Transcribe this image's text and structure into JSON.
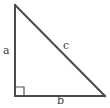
{
  "figure": {
    "name": "right-triangle",
    "background_color": "#ffffff",
    "stroke_color": "#4a4a4a",
    "label_color": "#3a3a3a",
    "stroke_width": 2,
    "marker_stroke_width": 1.2
  },
  "vertices": {
    "apex": {
      "x": 15,
      "y": 5
    },
    "right_angle_corner": {
      "x": 15,
      "y": 96
    },
    "base_right": {
      "x": 105,
      "y": 96
    }
  },
  "right_angle_marker": {
    "name": "right-angle-marker",
    "size": 9,
    "x": 15,
    "y": 96
  },
  "labels": {
    "leg_vertical": "a",
    "leg_horizontal": "b",
    "hypotenuse": "c"
  },
  "chart_data": {
    "type": "diagram",
    "title": "",
    "shape": "right triangle",
    "sides": [
      {
        "name": "a",
        "role": "vertical leg",
        "from": "apex",
        "to": "right_angle_corner",
        "label_position": "left of leg"
      },
      {
        "name": "b",
        "role": "horizontal leg",
        "from": "right_angle_corner",
        "to": "base_right",
        "label_position": "below leg"
      },
      {
        "name": "c",
        "role": "hypotenuse",
        "from": "apex",
        "to": "base_right",
        "label_position": "above-right of midpoint"
      }
    ],
    "angles": [
      {
        "vertex": "right_angle_corner",
        "measure_deg": 90,
        "marked": true
      }
    ]
  }
}
